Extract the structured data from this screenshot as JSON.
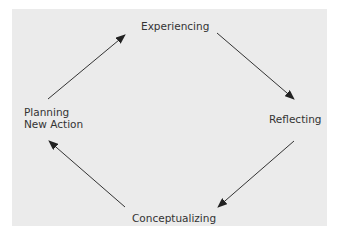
{
  "diagram": {
    "type": "cycle",
    "nodes": [
      {
        "id": "experiencing",
        "label": "Experiencing"
      },
      {
        "id": "reflecting",
        "label": "Reflecting"
      },
      {
        "id": "conceptualizing",
        "label": "Conceptualizing"
      },
      {
        "id": "planning",
        "label_line1": "Planning",
        "label_line2": "New Action"
      }
    ],
    "edges": [
      {
        "from": "planning",
        "to": "experiencing"
      },
      {
        "from": "experiencing",
        "to": "reflecting"
      },
      {
        "from": "reflecting",
        "to": "conceptualizing"
      },
      {
        "from": "conceptualizing",
        "to": "planning"
      }
    ],
    "colors": {
      "background": "#ebebeb",
      "line": "#333333",
      "text": "#333333"
    }
  }
}
